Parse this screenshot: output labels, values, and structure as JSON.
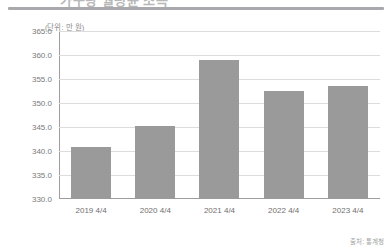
{
  "headline": "가구당 월평균 소득",
  "unit_label": "(단위: 만 원)",
  "source_note": "출처: 통계청",
  "colors": {
    "bar": "#9a9a9a",
    "grid": "#dcdcdc",
    "axis": "#9d9d9d",
    "tick_text": "#7a7a7a"
  },
  "chart_data": {
    "type": "bar",
    "title": "가구당 월평균 소득",
    "xlabel": "",
    "ylabel": "",
    "unit": "만 원",
    "categories": [
      "2019 4/4",
      "2020 4/4",
      "2021 4/4",
      "2022 4/4",
      "2023 4/4"
    ],
    "values": [
      340.9,
      345.3,
      358.9,
      352.5,
      353.5
    ],
    "ylim": [
      330.0,
      365.0
    ],
    "yticks": [
      "330.0",
      "335.0",
      "340.0",
      "345.0",
      "350.0",
      "355.0",
      "360.0",
      "365.0"
    ],
    "ytick_values": [
      330.0,
      335.0,
      340.0,
      345.0,
      350.0,
      355.0,
      360.0,
      365.0
    ],
    "grid": true,
    "legend": false,
    "series": [
      {
        "name": "가구당 월평균 소득",
        "values": [
          340.9,
          345.3,
          358.9,
          352.5,
          353.5
        ]
      }
    ]
  }
}
